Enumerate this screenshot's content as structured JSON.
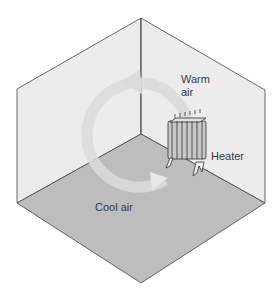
{
  "diagram": {
    "labels": {
      "warm_air_line1": "Warm",
      "warm_air_line2": "air",
      "heater": "Heater",
      "cool_air": "Cool air"
    },
    "colors": {
      "wall": "#ececec",
      "floor": "#bdbdbd",
      "edge": "#444444",
      "arrow": "#dcdcdc",
      "text": "#3a3a3a"
    }
  }
}
